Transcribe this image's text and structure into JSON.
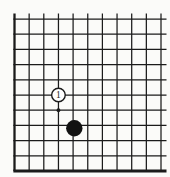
{
  "board": {
    "visible_cols": 11,
    "visible_rows": 11,
    "edge_left": true,
    "edge_bottom": true,
    "cropped_top": true,
    "cropped_right": true,
    "line_color": "#1b1b1b",
    "background_color": "#fbfbf9",
    "white_stone_fill": "#ffffff",
    "black_stone_fill": "#121212"
  },
  "stones": [
    {
      "color": "white",
      "label": "1",
      "col": 4,
      "row": 6
    },
    {
      "color": "black",
      "label": "",
      "col": 5,
      "row": 8
    }
  ],
  "markers": [
    {
      "type": "star-point",
      "col": 4,
      "row": 7
    }
  ]
}
